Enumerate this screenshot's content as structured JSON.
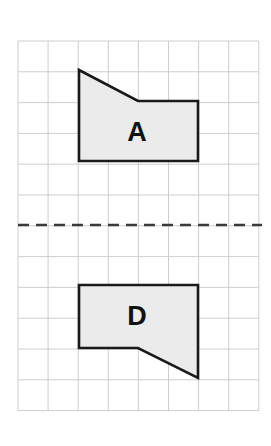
{
  "worksheet": {
    "title": "Reflection of shape A across a horizontal mirror line to shape D",
    "background_color": "#ffffff",
    "width": 271,
    "height": 446
  },
  "grid": {
    "name": "square-grid",
    "left": 18,
    "top": 41,
    "right": 259,
    "bottom": 411,
    "columns": 8,
    "rows": 12,
    "cell_width": 30.1,
    "cell_height": 30.8,
    "line_color": "#c8c8c8",
    "line_width": 0.9
  },
  "mirror_line": {
    "name": "mirror-line",
    "orientation": "horizontal",
    "y": 225,
    "x_start": 18,
    "x_end": 262,
    "style": "dashed",
    "dash_pattern": "11 7",
    "color": "#3a3a3a",
    "line_width": 2.6
  },
  "shapes": [
    {
      "id": "A",
      "name": "shape-a",
      "label": "A",
      "label_x": 137,
      "label_y": 134,
      "fill": "#ebebeb",
      "stroke": "#1a1a1a",
      "stroke_width": 2.6,
      "points": "79,70 138,101 198,101 198,161 79,161"
    },
    {
      "id": "D",
      "name": "shape-d",
      "label": "D",
      "label_x": 137,
      "label_y": 318,
      "fill": "#ebebeb",
      "stroke": "#1a1a1a",
      "stroke_width": 2.6,
      "points": "79,285 198,285 198,378 138,348 79,348"
    }
  ]
}
